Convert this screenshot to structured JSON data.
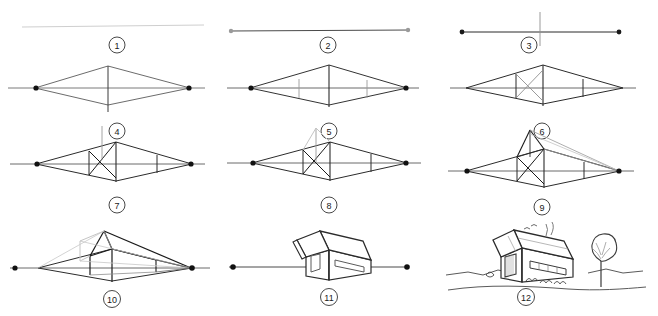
{
  "figure": {
    "type": "instructional-diagram",
    "columns": 3,
    "rows": 4,
    "panel_count": 12,
    "background_color": "#ffffff",
    "ink_color": "#1a1a1a",
    "construction_color": "#8a8a8a",
    "faint_color": "#c9c9c9"
  },
  "panels": [
    {
      "number": "1",
      "caption_number": "1",
      "step_name": "horizon-line",
      "description": "A single faint horizontal horizon line is drawn across the page.",
      "col": 0,
      "row": 0
    },
    {
      "number": "2",
      "caption_number": "2",
      "step_name": "vanishing-points",
      "description": "Two vanishing points are marked as dots at the far left and far right of the horizon line.",
      "col": 1,
      "row": 0
    },
    {
      "number": "3",
      "caption_number": "3",
      "step_name": "leading-vertical-edge",
      "description": "A vertical line is drawn crossing the horizon between the two vanishing points; this is the near corner of the building.",
      "col": 2,
      "row": 0
    },
    {
      "number": "4",
      "caption_number": "4",
      "step_name": "convergence-lines",
      "description": "Lines are drawn from the top and bottom of the vertical edge to both vanishing points, forming a diamond.",
      "col": 0,
      "row": 1
    },
    {
      "number": "5",
      "caption_number": "5",
      "step_name": "box-side-edges",
      "description": "Two more vertical lines cut the diamond, closing off the two visible side walls of the box.",
      "col": 1,
      "row": 1
    },
    {
      "number": "6",
      "caption_number": "6",
      "step_name": "diagonals-for-centre",
      "description": "Diagonals are crossed inside the left wall panel to locate its exact perspective centre.",
      "col": 2,
      "row": 1
    },
    {
      "number": "7",
      "caption_number": "7",
      "step_name": "ridge-height-line",
      "description": "A vertical line is raised from the crossing point of the diagonals to set the roof ridge height.",
      "col": 0,
      "row": 2
    },
    {
      "number": "8",
      "caption_number": "8",
      "step_name": "gable-triangle",
      "description": "The gable triangle is sketched from the ridge point down to the two top corners of the end wall.",
      "col": 1,
      "row": 2
    },
    {
      "number": "9",
      "caption_number": "9",
      "step_name": "ridge-to-vanishing-point",
      "description": "The ridge is projected back toward the right vanishing point and the far gable is found.",
      "col": 2,
      "row": 2
    },
    {
      "number": "10",
      "caption_number": "10",
      "step_name": "roof-planes-and-overhang",
      "description": "Roof planes and the overhanging eaves are constructed over the box; the main outline is darkened.",
      "col": 0,
      "row": 3
    },
    {
      "number": "11",
      "caption_number": "11",
      "step_name": "clean-outline",
      "description": "Construction lines are erased, leaving the clean house with a door and a long window.",
      "col": 1,
      "row": 3
    },
    {
      "number": "12",
      "caption_number": "12",
      "step_name": "finished-rendering",
      "description": "The finished drawing adds texture, a chimney with smoke, birds, a tree, shrubs and the ground line.",
      "col": 2,
      "row": 3
    }
  ],
  "layout": {
    "panel_width": 219,
    "panel_height": 105,
    "origins": [
      {
        "x": 0,
        "y": 0
      },
      {
        "x": 219,
        "y": 0
      },
      {
        "x": 438,
        "y": 0
      },
      {
        "x": 0,
        "y": 55
      },
      {
        "x": 219,
        "y": 55
      },
      {
        "x": 438,
        "y": 55
      },
      {
        "x": 0,
        "y": 120
      },
      {
        "x": 219,
        "y": 120
      },
      {
        "x": 438,
        "y": 120
      },
      {
        "x": 0,
        "y": 215
      },
      {
        "x": 219,
        "y": 215
      },
      {
        "x": 438,
        "y": 215
      }
    ]
  }
}
